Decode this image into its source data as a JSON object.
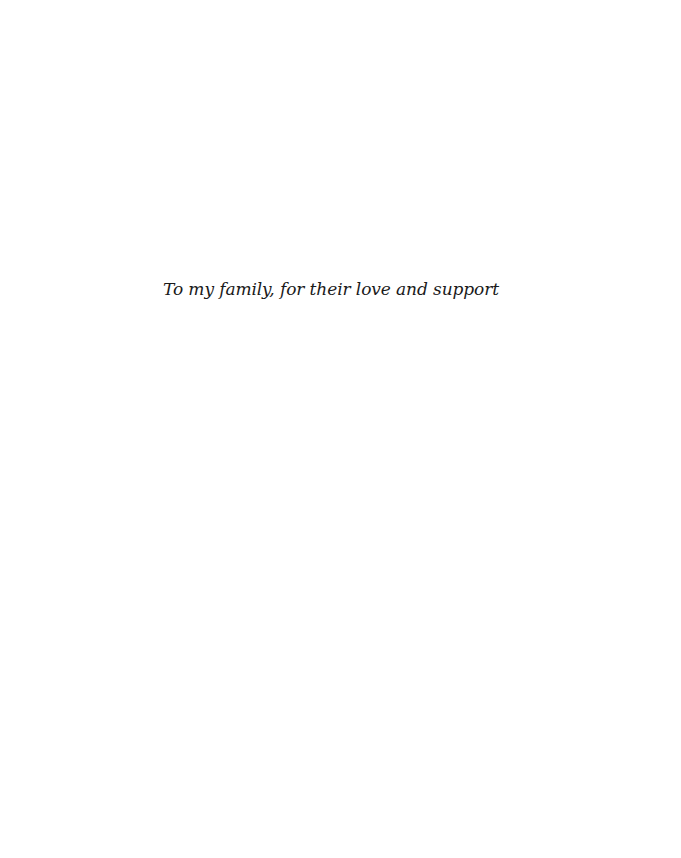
{
  "page": {
    "dedication": "To my family, for their love and support"
  }
}
